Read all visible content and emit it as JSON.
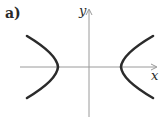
{
  "figure": {
    "panel_label": "a)",
    "axes": {
      "x_label": "x",
      "y_label": "y"
    },
    "curve": "hyperbola opening left and right (x^2/a^2 - y^2/b^2 = 1)",
    "colors": {
      "axis": "#9a9a9a",
      "curve": "#2b2b2b",
      "text": "#2a2a2a"
    }
  }
}
